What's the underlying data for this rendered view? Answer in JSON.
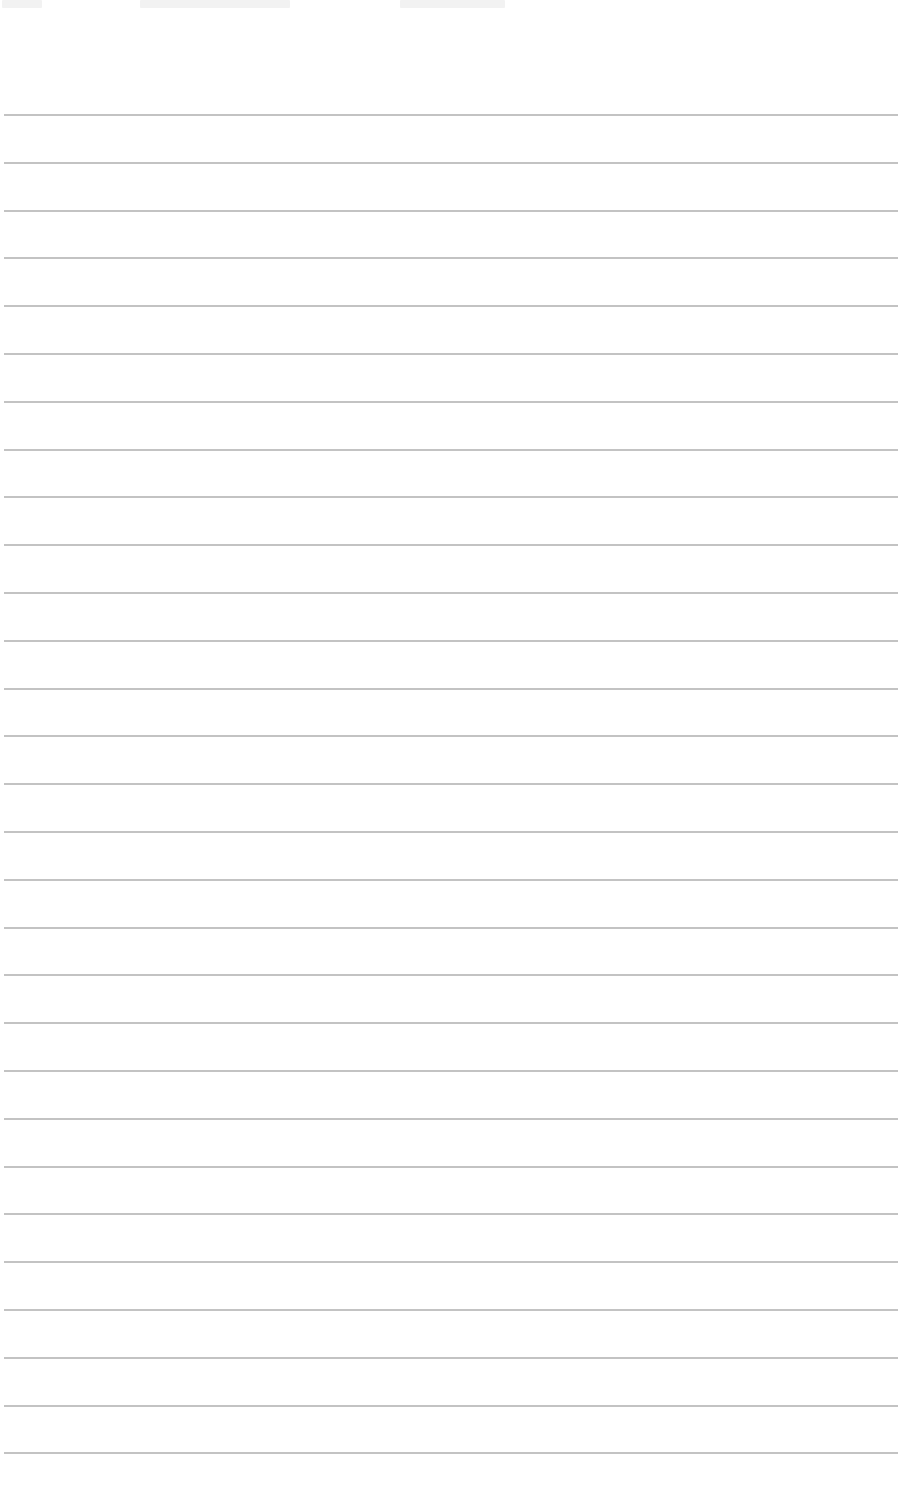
{
  "page": {
    "type": "lined-paper",
    "background": "#ffffff",
    "rule_color": "#b9b9b9",
    "rule_count": 29,
    "first_rule_y": 114,
    "rule_spacing": 47.8
  },
  "header_fragments": [
    {
      "x": 2,
      "w": 40
    },
    {
      "x": 140,
      "w": 150
    },
    {
      "x": 400,
      "w": 105
    }
  ]
}
